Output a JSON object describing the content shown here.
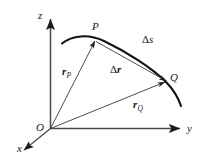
{
  "figure": {
    "kind": "vector-kinematics-diagram",
    "background_color": "#ffffff",
    "ink_color": "#1a1a1a",
    "axes": {
      "z_label": "z",
      "y_label": "y",
      "x_label": "x",
      "origin_label": "O"
    },
    "points": {
      "p_label": "P",
      "q_label": "Q"
    },
    "vectors": {
      "r_p": {
        "symbol": "r",
        "subscript": "P"
      },
      "r_q": {
        "symbol": "r",
        "subscript": "Q"
      },
      "delta_r": {
        "delta": "Δ",
        "symbol": "r"
      },
      "delta_s": {
        "delta": "Δ",
        "symbol": "s"
      }
    }
  }
}
